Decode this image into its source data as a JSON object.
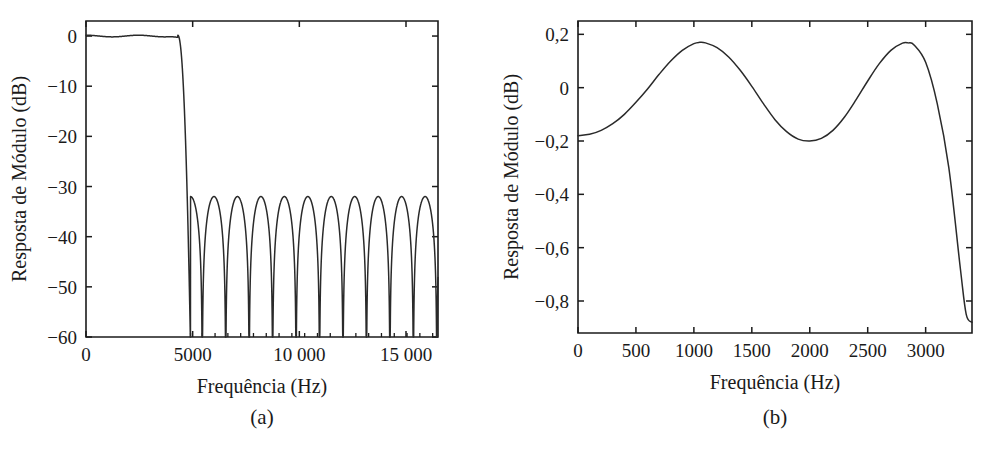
{
  "figure": {
    "background_color": "#ffffff",
    "line_color": "#2a2a2a",
    "axis_color": "#1b1b1b",
    "panels": [
      {
        "caption": "(a)"
      },
      {
        "caption": "(b)"
      }
    ]
  },
  "chart_data": [
    {
      "type": "line",
      "panel": "a",
      "title": "",
      "subtitle": "",
      "caption": "(a)",
      "xlabel": "Frequência (Hz)",
      "ylabel": "Resposta de Módulo (dB)",
      "xlim": [
        0,
        16500
      ],
      "ylim": [
        -60,
        3
      ],
      "xticks": [
        0,
        5000,
        10000,
        15000
      ],
      "xticklabels": [
        "0",
        "5000",
        "10 000",
        "15 000"
      ],
      "xticks_minor": [
        4900,
        5450,
        6050,
        6650,
        7250,
        7850,
        8450,
        9050,
        9650,
        10250,
        10850,
        11450,
        12050,
        12650,
        13250,
        13850,
        14450,
        15050,
        15650,
        16250
      ],
      "yticks": [
        0,
        -10,
        -20,
        -30,
        -40,
        -50,
        -60
      ],
      "yticklabels": [
        "0",
        "−10",
        "−20",
        "−30",
        "−40",
        "−50",
        "−60"
      ],
      "grid": false,
      "legend": null,
      "annotations": [],
      "description": "Resposta em módulo de filtro passa-baixas: banda de passagem plana em 0 dB até cerca de 4300 Hz, transição abrupta e banda de rejeição equiripple com lóbulos em -32 dB.",
      "series": [
        {
          "name": "Resposta de Módulo",
          "passband_ripple_db": 0.17,
          "passband_edge_hz": 4300,
          "transition_center_hz": 4700,
          "stopband_edge_hz": 4900,
          "stopband_level_db": -32,
          "null_count": 10,
          "x": [
            0,
            200,
            400,
            600,
            800,
            1000,
            1200,
            1400,
            1600,
            1800,
            2000,
            2200,
            2400,
            2600,
            2800,
            3000,
            3200,
            3400,
            3600,
            3800,
            4000,
            4200,
            4400,
            4600,
            4800,
            5000,
            5200,
            5400,
            5600,
            5800,
            6000,
            6200,
            6400,
            6600,
            6800,
            7000,
            7200,
            7400
          ],
          "y": [
            -0.18,
            -0.05,
            0.08,
            0.14,
            0.15,
            0.1,
            0.02,
            -0.05,
            -0.1,
            -0.12,
            -0.1,
            -0.04,
            0.04,
            0.12,
            0.16,
            0.13,
            0.02,
            -0.2,
            -0.8,
            -2.2,
            -5.5,
            -11.5,
            -20.5,
            -34,
            -55,
            -38,
            -32.4,
            -33.8,
            -45,
            -60,
            -42,
            -33.5,
            -32.2,
            -34.5,
            -48,
            -60,
            -44,
            -33.6
          ]
        }
      ]
    },
    {
      "type": "line",
      "panel": "b",
      "title": "",
      "subtitle": "",
      "caption": "(b)",
      "xlabel": "Frequência (Hz)",
      "ylabel": "Resposta de Módulo (dB)",
      "xlim": [
        0,
        3400
      ],
      "ylim": [
        -0.92,
        0.25
      ],
      "xticks": [
        0,
        500,
        1000,
        1500,
        2000,
        2500,
        3000
      ],
      "xticklabels": [
        "0",
        "500",
        "1000",
        "1500",
        "2000",
        "2500",
        "3000"
      ],
      "yticks": [
        0.2,
        0,
        -0.2,
        -0.4,
        -0.6,
        -0.8
      ],
      "yticklabels": [
        "0,2",
        "0",
        "−0,2",
        "−0,4",
        "−0,6",
        "−0,8"
      ],
      "grid": false,
      "legend": null,
      "annotations": [],
      "description": "Detalhe da banda de passagem mostrando ondulação equiripple entre -0,20 dB e +0,17 dB e queda acentuada na borda da banda.",
      "series": [
        {
          "name": "Resposta de Módulo",
          "ripple_max_db": 0.17,
          "ripple_min_db": -0.2,
          "peaks_hz": [
            1050,
            2850
          ],
          "valleys_hz": [
            2000
          ],
          "edge_value_db": -0.85,
          "x": [
            0,
            100,
            200,
            300,
            400,
            500,
            600,
            700,
            800,
            900,
            1000,
            1050,
            1100,
            1200,
            1300,
            1400,
            1500,
            1600,
            1700,
            1800,
            1900,
            2000,
            2100,
            2200,
            2300,
            2400,
            2500,
            2600,
            2700,
            2800,
            2850,
            2900,
            3000,
            3100,
            3200,
            3300,
            3350,
            3400
          ],
          "y": [
            -0.18,
            -0.175,
            -0.16,
            -0.135,
            -0.1,
            -0.055,
            -0.005,
            0.05,
            0.1,
            0.14,
            0.165,
            0.17,
            0.168,
            0.15,
            0.115,
            0.065,
            0.005,
            -0.06,
            -0.12,
            -0.165,
            -0.193,
            -0.2,
            -0.19,
            -0.16,
            -0.11,
            -0.045,
            0.025,
            0.09,
            0.14,
            0.167,
            0.168,
            0.16,
            0.095,
            -0.06,
            -0.3,
            -0.68,
            -0.85,
            -0.88
          ]
        }
      ]
    }
  ]
}
